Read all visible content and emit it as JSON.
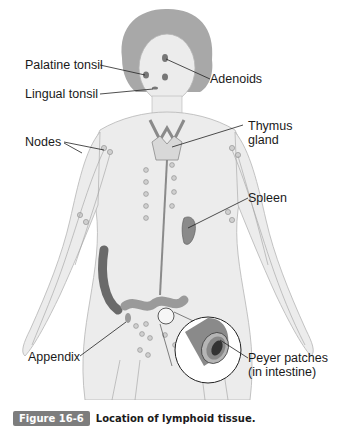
{
  "figure": {
    "labels": {
      "palatine_tonsil": "Palatine tonsil",
      "adenoids": "Adenoids",
      "lingual_tonsil": "Lingual tonsil",
      "nodes": "Nodes",
      "thymus_line1": "Thymus",
      "thymus_line2": "gland",
      "spleen": "Spleen",
      "appendix": "Appendix",
      "peyer_line1": "Peyer patches",
      "peyer_line2": "(in intestine)"
    },
    "colors": {
      "body_fill": "#ececec",
      "body_outline": "#b5b5b5",
      "hair": "#a8a8a8",
      "organ": "#8a8a8a",
      "vessel": "#9a9a9a",
      "leader_line": "#222222"
    }
  },
  "caption": {
    "number": "Figure 16-6",
    "text": "Location of lymphoid tissue.",
    "badge_color": "#7d7d7d"
  }
}
